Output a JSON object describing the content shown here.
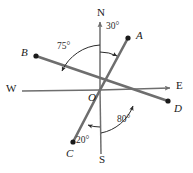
{
  "figure": {
    "kind": "compass-bearing-diagram",
    "width": 193,
    "height": 173,
    "background": "#ffffff",
    "origin_label": "O",
    "origin": {
      "x": 100,
      "y": 90
    },
    "colors": {
      "ray": "#6e6e6e",
      "axis": "#6e6e6e",
      "point": "#1a1a1a",
      "text": "#1a1a1a",
      "arc": "#2b2b2b"
    },
    "compass": [
      {
        "id": "north",
        "label": "N",
        "x": 100,
        "y": 13
      },
      {
        "id": "south",
        "label": "S",
        "x": 102,
        "y": 160
      },
      {
        "id": "east",
        "label": "E",
        "x": 180,
        "y": 86
      },
      {
        "id": "west",
        "label": "W",
        "x": 11,
        "y": 89
      }
    ],
    "points": [
      {
        "id": "A",
        "label": "A",
        "dot_x": 128,
        "dot_y": 38,
        "label_x": 139,
        "label_y": 36
      },
      {
        "id": "B",
        "label": "B",
        "dot_x": 36,
        "dot_y": 56,
        "label_x": 23,
        "label_y": 53
      },
      {
        "id": "C",
        "label": "C",
        "dot_x": 73,
        "dot_y": 142,
        "label_x": 69,
        "label_y": 156
      },
      {
        "id": "D",
        "label": "D",
        "dot_x": 168,
        "dot_y": 101,
        "label_x": 177,
        "label_y": 110
      }
    ],
    "angles": [
      {
        "id": "angle-noa",
        "label": "30°",
        "from": "N",
        "to": "A",
        "value": 30,
        "label_x": 110,
        "label_y": 28
      },
      {
        "id": "angle-nob",
        "label": "75°",
        "from": "N",
        "to": "B",
        "value": 75,
        "label_x": 62,
        "label_y": 48
      },
      {
        "id": "angle-soc",
        "label": "20°",
        "from": "S",
        "to": "C",
        "value": 20,
        "label_x": 81,
        "label_y": 142
      },
      {
        "id": "angle-sod",
        "label": "80°",
        "from": "S",
        "to": "D",
        "value": 80,
        "label_x": 122,
        "label_y": 121
      }
    ]
  }
}
